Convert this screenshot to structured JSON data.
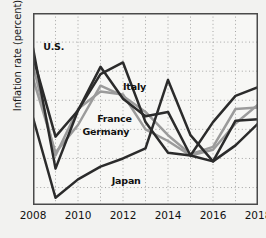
{
  "chart_data": {
    "type": "line",
    "title": "",
    "xlabel": "",
    "ylabel": "Inflation rate (percent)",
    "xlim": [
      2008,
      2018
    ],
    "ylim": [
      -1.6,
      5
    ],
    "grid": true,
    "grid_style": "dotted",
    "legend_position": "inline-annotations",
    "x": [
      2008,
      2009,
      2010,
      2011,
      2012,
      2013,
      2014,
      2015,
      2016,
      2017,
      2018
    ],
    "xticks": [
      "2008",
      "2010",
      "2012",
      "2014",
      "2016",
      "2018"
    ],
    "xtick_values": [
      2008,
      2010,
      2012,
      2014,
      2016,
      2018
    ],
    "yticks": [
      "5",
      "4",
      "3",
      "2",
      "1",
      "0",
      "-1"
    ],
    "ytick_values": [
      5,
      4,
      3,
      2,
      1,
      0,
      -1
    ],
    "series": [
      {
        "name": "U.S.",
        "color": "#2b2b2b",
        "values": [
          3.8,
          -0.35,
          1.65,
          3.15,
          2.05,
          1.45,
          1.6,
          0.1,
          1.25,
          2.15,
          2.45
        ]
      },
      {
        "name": "Italy",
        "color": "#2b2b2b",
        "values": [
          3.5,
          0.75,
          1.65,
          2.9,
          3.3,
          1.25,
          0.2,
          0.1,
          -0.1,
          1.3,
          1.35
        ]
      },
      {
        "name": "France",
        "color": "#9b9b9b",
        "values": [
          3.2,
          0.1,
          1.7,
          2.3,
          2.2,
          1.0,
          0.6,
          0.1,
          0.3,
          1.2,
          1.85
        ]
      },
      {
        "name": "Germany",
        "color": "#9b9b9b",
        "values": [
          2.75,
          0.2,
          1.15,
          2.5,
          2.15,
          1.6,
          0.8,
          0.15,
          0.4,
          1.7,
          1.75
        ]
      },
      {
        "name": "Japan",
        "color": "#2b2b2b",
        "values": [
          1.4,
          -1.35,
          -0.72,
          -0.28,
          0.0,
          0.35,
          2.7,
          0.8,
          -0.1,
          0.45,
          1.2
        ]
      }
    ],
    "annotations": [
      {
        "label": "U.S.",
        "x": 2008.45,
        "y": 3.82
      },
      {
        "label": "Italy",
        "x": 2012.0,
        "y": 2.45
      },
      {
        "label": "France",
        "x": 2010.85,
        "y": 1.35
      },
      {
        "label": "Germany",
        "x": 2010.2,
        "y": 0.92
      },
      {
        "label": "Japan",
        "x": 2011.5,
        "y": -0.78
      }
    ]
  },
  "colors": {
    "background": "#f2f2f0",
    "frame": "#4a4a4a",
    "grid": "#9c9c9c",
    "dark_line": "#2b2b2b",
    "light_line": "#9b9b9b",
    "text": "#111111"
  }
}
